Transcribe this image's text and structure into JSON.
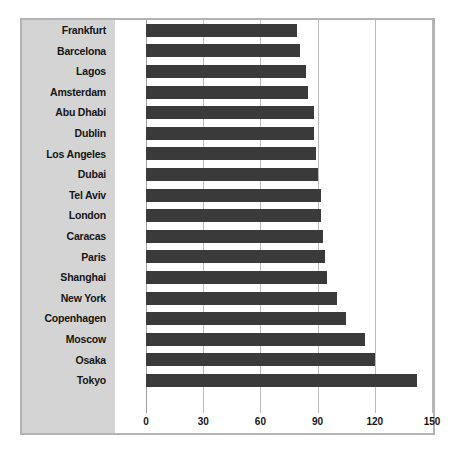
{
  "chart_data": {
    "type": "bar",
    "orientation": "horizontal",
    "title": "",
    "subtitle": "",
    "xlabel": "",
    "ylabel": "",
    "xlim": [
      0,
      150
    ],
    "ylim": null,
    "grid": true,
    "legend": null,
    "legend_position": "none",
    "xticks": [
      0,
      30,
      60,
      90,
      120,
      150
    ],
    "xtick_labels": [
      "0",
      "30",
      "60",
      "90",
      "120",
      "150"
    ],
    "categories": [
      "Frankfurt",
      "Barcelona",
      "Lagos",
      "Amsterdam",
      "Abu Dhabi",
      "Dublin",
      "Los Angeles",
      "Dubai",
      "Tel Aviv",
      "London",
      "Caracas",
      "Paris",
      "Shanghai",
      "New York",
      "Copenhagen",
      "Moscow",
      "Osaka",
      "Tokyo"
    ],
    "values": [
      79,
      81,
      84,
      85,
      88,
      88,
      89,
      90,
      92,
      92,
      93,
      94,
      95,
      100,
      105,
      115,
      120,
      142
    ],
    "series": [
      {
        "name": "",
        "values": [
          79,
          81,
          84,
          85,
          88,
          88,
          89,
          90,
          92,
          92,
          93,
          94,
          95,
          100,
          105,
          115,
          120,
          142
        ]
      }
    ],
    "annotations": []
  },
  "style": {
    "bar_color": "#3a3a3a",
    "plot_background": "#ffffff",
    "label_panel_background": "#d4d4d4",
    "gridline_color": "#b9b9b9",
    "frame_border_color": "#b3b3b3",
    "text_color": "#161616"
  }
}
